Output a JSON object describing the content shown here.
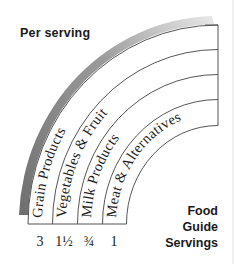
{
  "header": {
    "label": "Per serving"
  },
  "footer_label": {
    "lines": [
      "Food",
      "Guide",
      "Servings"
    ]
  },
  "colors": {
    "line": "#555555",
    "shadow": "#8a8a8a",
    "text": "#1c1c1c",
    "background": "#ffffff"
  },
  "bands": [
    {
      "name": "Grain Products",
      "serving": "3"
    },
    {
      "name": "Vegetables & Fruit",
      "serving": "1½"
    },
    {
      "name": "Milk Products",
      "serving": "¾"
    },
    {
      "name": "Meat & Alternatives",
      "serving": "1"
    }
  ]
}
